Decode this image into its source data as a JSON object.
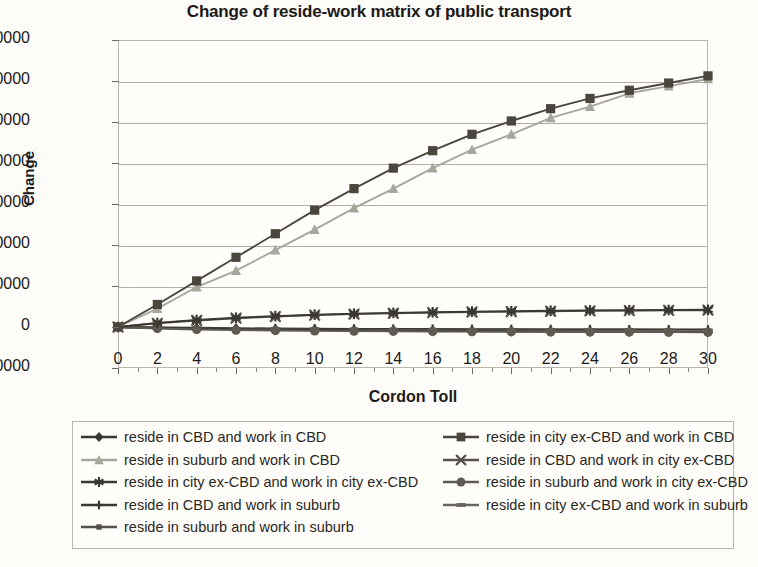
{
  "chart_data": {
    "type": "line",
    "title": "Change of reside-work matrix of public transport",
    "xlabel": "Cordon Toll",
    "ylabel": "Change",
    "xlim": [
      0,
      30
    ],
    "ylim": [
      -20000,
      140000
    ],
    "ytick_step": 20000,
    "xtick_step": 2,
    "grid": true,
    "legend_position": "bottom",
    "xticks": [
      "0",
      "2",
      "4",
      "6",
      "8",
      "10",
      "12",
      "14",
      "16",
      "18",
      "20",
      "22",
      "24",
      "26",
      "28",
      "30"
    ],
    "yticks": [
      "-20000",
      "0",
      "20000",
      "40000",
      "60000",
      "80000",
      "100000",
      "120000",
      "140000"
    ],
    "x": [
      0,
      2,
      4,
      6,
      8,
      10,
      12,
      14,
      16,
      18,
      20,
      22,
      24,
      26,
      28,
      30
    ],
    "series": [
      {
        "name": "reside in CBD and work in CBD",
        "marker": "diamond",
        "color": "#3b3832",
        "values": [
          0,
          -300,
          -600,
          -900,
          -1200,
          -1400,
          -1600,
          -1800,
          -1900,
          -2000,
          -2100,
          -2200,
          -2300,
          -2350,
          -2400,
          -2450
        ]
      },
      {
        "name": "reside in city ex-CBD and work in CBD",
        "marker": "square",
        "color": "#4a463e",
        "values": [
          0,
          11000,
          22500,
          34000,
          45500,
          57000,
          67500,
          77500,
          86000,
          94000,
          100500,
          106500,
          111500,
          115500,
          119000,
          122500
        ]
      },
      {
        "name": "reside in suburb and work in CBD",
        "marker": "triangle",
        "color": "#a8a69c",
        "values": [
          0,
          9000,
          19500,
          27500,
          37500,
          47500,
          58000,
          67500,
          77500,
          86500,
          94000,
          102000,
          107500,
          114000,
          117500,
          121000
        ]
      },
      {
        "name": "reside in CBD and work in city ex-CBD",
        "marker": "cross",
        "color": "#57534b",
        "values": [
          0,
          1800,
          3200,
          4300,
          5100,
          5800,
          6300,
          6700,
          7000,
          7300,
          7500,
          7700,
          7900,
          8000,
          8100,
          8200
        ]
      },
      {
        "name": "reside in city ex-CBD and work in city ex-CBD",
        "marker": "asterisk",
        "color": "#3b3832",
        "values": [
          0,
          2000,
          3400,
          4500,
          5300,
          6000,
          6500,
          6900,
          7200,
          7500,
          7700,
          7900,
          8100,
          8200,
          8300,
          8400
        ]
      },
      {
        "name": "reside in suburb and work in city ex-CBD",
        "marker": "circle",
        "color": "#5f5b53",
        "values": [
          0,
          -700,
          -1200,
          -1500,
          -1700,
          -1900,
          -2000,
          -2100,
          -2200,
          -2250,
          -2300,
          -2350,
          -2400,
          -2450,
          -2500,
          -2550
        ]
      },
      {
        "name": "reside in CBD and work in suburb",
        "marker": "plus",
        "color": "#3b3832",
        "values": [
          0,
          -200,
          -400,
          -600,
          -700,
          -800,
          -900,
          -950,
          -1000,
          -1050,
          -1100,
          -1150,
          -1200,
          -1250,
          -1300,
          -1350
        ]
      },
      {
        "name": "reside in city ex-CBD and work in suburb",
        "marker": "dash",
        "color": "#6b675f",
        "values": [
          0,
          -400,
          -700,
          -1000,
          -1200,
          -1400,
          -1500,
          -1600,
          -1700,
          -1750,
          -1800,
          -1850,
          -1900,
          -1950,
          -2000,
          -2050
        ]
      },
      {
        "name": "reside in suburb and work in suburb",
        "marker": "smallsquare",
        "color": "#555149",
        "values": [
          0,
          -500,
          -900,
          -1200,
          -1450,
          -1650,
          -1800,
          -1900,
          -2000,
          -2080,
          -2150,
          -2200,
          -2260,
          -2300,
          -2350,
          -2400
        ]
      }
    ]
  },
  "legend": {
    "left_column": [
      "reside in CBD and work in CBD",
      "reside in suburb and work in CBD",
      "reside in city ex-CBD and work in city ex-CBD",
      "reside in CBD and work in suburb",
      "reside in suburb and work in suburb"
    ],
    "right_column": [
      "reside in city ex-CBD and work in CBD",
      "reside in CBD and work in city ex-CBD",
      "reside in suburb and work in city ex-CBD",
      "reside in city ex-CBD and work in suburb"
    ]
  },
  "colors": {
    "dark": "#3b3832",
    "mid": "#5f5b53",
    "light": "#a8a69c",
    "grid": "#b2aea4",
    "frame": "#b9b5ab",
    "background": "#fdfcf8"
  }
}
